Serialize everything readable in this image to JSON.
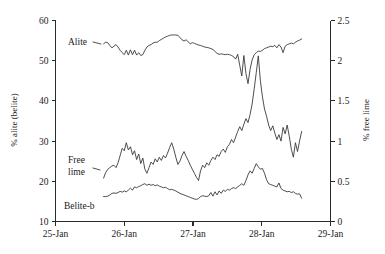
{
  "chart_data": {
    "type": "line",
    "title": "",
    "xlabel": "",
    "ylabel": "% alite (belite)",
    "y2label": "% free lime",
    "grid": false,
    "legend": "inline-labels",
    "xlim": [
      25,
      29
    ],
    "ylim": [
      10,
      60
    ],
    "y2lim": [
      0,
      2.5
    ],
    "x_tick_labels": [
      "25-Jan",
      "26-Jan",
      "27-Jan",
      "28-Jan",
      "29-Jan"
    ],
    "x_tick_values": [
      25,
      26,
      27,
      28,
      29
    ],
    "y_tick_labels": [
      "10",
      "20",
      "30",
      "40",
      "50",
      "60"
    ],
    "y_tick_values": [
      10,
      20,
      30,
      40,
      50,
      60
    ],
    "y2_tick_labels": [
      "0",
      "0.5",
      "1",
      "1.5",
      "2",
      "2.5"
    ],
    "y2_tick_values": [
      0,
      0.5,
      1,
      1.5,
      2,
      2.5
    ],
    "series": [
      {
        "name": "Alite",
        "axis": "left",
        "label_text": "Alite",
        "x": [
          25.7,
          25.73,
          25.76,
          25.79,
          25.82,
          25.85,
          25.88,
          25.91,
          25.94,
          25.97,
          26.0,
          26.03,
          26.06,
          26.09,
          26.12,
          26.15,
          26.18,
          26.21,
          26.24,
          26.27,
          26.3,
          26.33,
          26.36,
          26.39,
          26.42,
          26.45,
          26.48,
          26.51,
          26.54,
          26.57,
          26.6,
          26.63,
          26.66,
          26.69,
          26.72,
          26.75,
          26.78,
          26.81,
          26.84,
          26.87,
          26.9,
          26.93,
          26.96,
          26.99,
          27.02,
          27.05,
          27.08,
          27.11,
          27.14,
          27.17,
          27.2,
          27.23,
          27.26,
          27.29,
          27.32,
          27.35,
          27.38,
          27.41,
          27.44,
          27.47,
          27.5,
          27.53,
          27.56,
          27.59,
          27.62,
          27.65,
          27.68,
          27.71,
          27.74,
          27.77,
          27.8,
          27.83,
          27.86,
          27.89,
          27.92,
          27.95,
          27.98,
          28.01,
          28.04,
          28.07,
          28.1,
          28.13,
          28.16,
          28.19,
          28.22,
          28.25,
          28.28,
          28.31,
          28.34,
          28.37,
          28.4,
          28.43,
          28.46,
          28.49,
          28.52,
          28.55,
          28.58
        ],
        "y": [
          54.2,
          54.6,
          54.5,
          53.8,
          53.2,
          53.6,
          54.0,
          53.4,
          52.6,
          52.0,
          51.5,
          52.6,
          51.4,
          52.7,
          51.5,
          52.6,
          51.4,
          52.0,
          51.3,
          51.5,
          52.6,
          53.4,
          53.8,
          54.0,
          54.4,
          54.6,
          54.6,
          55.0,
          55.3,
          55.6,
          55.9,
          56.1,
          56.3,
          56.4,
          56.4,
          56.4,
          56.3,
          55.8,
          55.2,
          54.9,
          55.2,
          54.7,
          54.2,
          54.5,
          54.3,
          54.1,
          53.9,
          53.8,
          53.6,
          53.4,
          53.3,
          53.2,
          53.0,
          52.8,
          52.3,
          51.8,
          51.6,
          51.7,
          51.6,
          51.5,
          51.6,
          51.5,
          51.3,
          51.0,
          50.4,
          51.6,
          48.8,
          46.2,
          51.3,
          46.8,
          44.3,
          47.8,
          50.2,
          51.5,
          52.0,
          52.4,
          52.3,
          52.6,
          53.0,
          53.2,
          53.4,
          53.6,
          53.5,
          53.8,
          53.2,
          54.0,
          53.4,
          52.0,
          53.6,
          54.0,
          54.2,
          54.4,
          54.2,
          54.6,
          54.9,
          55.1,
          55.4
        ],
        "value_range_left_axis": [
          44.3,
          56.4
        ]
      },
      {
        "name": "Free lime",
        "axis": "right",
        "label_text": "Free lime",
        "x": [
          25.7,
          25.73,
          25.76,
          25.79,
          25.82,
          25.85,
          25.88,
          25.91,
          25.94,
          25.97,
          26.0,
          26.03,
          26.06,
          26.09,
          26.12,
          26.15,
          26.18,
          26.21,
          26.24,
          26.27,
          26.3,
          26.33,
          26.36,
          26.39,
          26.42,
          26.45,
          26.48,
          26.51,
          26.54,
          26.57,
          26.6,
          26.63,
          26.66,
          26.69,
          26.72,
          26.75,
          26.78,
          26.81,
          26.84,
          26.87,
          26.9,
          26.93,
          26.96,
          26.99,
          27.02,
          27.05,
          27.08,
          27.11,
          27.14,
          27.17,
          27.2,
          27.23,
          27.26,
          27.29,
          27.32,
          27.35,
          27.38,
          27.41,
          27.44,
          27.47,
          27.5,
          27.53,
          27.56,
          27.59,
          27.62,
          27.65,
          27.68,
          27.71,
          27.74,
          27.77,
          27.8,
          27.83,
          27.86,
          27.89,
          27.92,
          27.95,
          27.98,
          28.01,
          28.04,
          28.07,
          28.1,
          28.13,
          28.16,
          28.19,
          28.22,
          28.25,
          28.28,
          28.31,
          28.34,
          28.37,
          28.4,
          28.43,
          28.46,
          28.49,
          28.52,
          28.55,
          28.58
        ],
        "y_left_axis_equiv": [
          20.8,
          22.2,
          23.0,
          23.5,
          23.8,
          24.0,
          23.5,
          24.6,
          26.4,
          28.2,
          27.6,
          29.6,
          27.8,
          28.6,
          26.6,
          27.6,
          25.4,
          26.8,
          24.5,
          25.8,
          23.0,
          22.0,
          23.4,
          24.8,
          24.2,
          25.6,
          24.8,
          26.0,
          25.2,
          26.5,
          25.8,
          27.0,
          28.4,
          29.7,
          28.0,
          26.0,
          24.2,
          25.0,
          26.4,
          27.5,
          26.2,
          25.2,
          24.0,
          23.0,
          22.0,
          21.0,
          20.2,
          22.6,
          24.0,
          23.4,
          24.6,
          24.0,
          25.2,
          26.0,
          25.4,
          26.6,
          26.2,
          27.4,
          28.0,
          27.2,
          28.6,
          29.2,
          30.4,
          29.6,
          31.0,
          32.4,
          33.6,
          32.6,
          34.2,
          35.6,
          34.6,
          36.6,
          39.2,
          43.0,
          47.0,
          51.2,
          45.0,
          41.0,
          38.0,
          36.2,
          34.0,
          32.6,
          33.8,
          32.0,
          30.4,
          31.6,
          30.0,
          33.4,
          31.8,
          34.0,
          31.2,
          28.0,
          26.0,
          29.6,
          27.4,
          30.0,
          32.4
        ],
        "y": [
          0.54,
          0.61,
          0.65,
          0.67,
          0.69,
          0.7,
          0.67,
          0.73,
          0.82,
          0.91,
          0.88,
          0.98,
          0.89,
          0.93,
          0.83,
          0.88,
          0.77,
          0.84,
          0.72,
          0.79,
          0.65,
          0.6,
          0.67,
          0.74,
          0.71,
          0.78,
          0.74,
          0.8,
          0.76,
          0.82,
          0.79,
          0.85,
          0.92,
          0.98,
          0.9,
          0.8,
          0.71,
          0.75,
          0.82,
          0.87,
          0.81,
          0.76,
          0.7,
          0.65,
          0.6,
          0.55,
          0.51,
          0.63,
          0.7,
          0.67,
          0.73,
          0.7,
          0.76,
          0.8,
          0.77,
          0.83,
          0.81,
          0.87,
          0.9,
          0.86,
          0.93,
          0.96,
          1.02,
          0.98,
          1.05,
          1.12,
          1.18,
          1.13,
          1.21,
          1.28,
          1.23,
          1.33,
          1.46,
          1.65,
          1.85,
          2.06,
          1.75,
          1.55,
          1.4,
          1.31,
          1.2,
          1.13,
          1.19,
          1.1,
          1.02,
          1.08,
          1.0,
          1.17,
          1.09,
          1.2,
          1.06,
          0.9,
          0.8,
          0.98,
          0.87,
          1.0,
          1.12
        ],
        "value_range_right_axis": [
          0.51,
          2.06
        ]
      },
      {
        "name": "Belite-b",
        "axis": "left",
        "label_text": "Belite-b",
        "x": [
          25.7,
          25.73,
          25.76,
          25.79,
          25.82,
          25.85,
          25.88,
          25.91,
          25.94,
          25.97,
          26.0,
          26.03,
          26.06,
          26.09,
          26.12,
          26.15,
          26.18,
          26.21,
          26.24,
          26.27,
          26.3,
          26.33,
          26.36,
          26.39,
          26.42,
          26.45,
          26.48,
          26.51,
          26.54,
          26.57,
          26.6,
          26.63,
          26.66,
          26.69,
          26.72,
          26.75,
          26.78,
          26.81,
          26.84,
          26.87,
          26.9,
          26.93,
          26.96,
          26.99,
          27.02,
          27.05,
          27.08,
          27.11,
          27.14,
          27.17,
          27.2,
          27.23,
          27.26,
          27.29,
          27.32,
          27.35,
          27.38,
          27.41,
          27.44,
          27.47,
          27.5,
          27.53,
          27.56,
          27.59,
          27.62,
          27.65,
          27.68,
          27.71,
          27.74,
          27.77,
          27.8,
          27.83,
          27.86,
          27.89,
          27.92,
          27.95,
          27.98,
          28.01,
          28.04,
          28.07,
          28.1,
          28.13,
          28.16,
          28.19,
          28.22,
          28.25,
          28.28,
          28.31,
          28.34,
          28.37,
          28.4,
          28.43,
          28.46,
          28.49,
          28.52,
          28.55,
          28.58
        ],
        "y": [
          16.2,
          16.2,
          16.3,
          16.6,
          17.0,
          17.1,
          17.0,
          17.2,
          17.5,
          17.3,
          17.6,
          17.4,
          17.8,
          18.3,
          17.8,
          18.6,
          18.4,
          18.7,
          18.9,
          19.2,
          19.4,
          19.0,
          19.3,
          19.0,
          19.2,
          18.9,
          19.1,
          18.8,
          18.6,
          18.4,
          18.5,
          18.2,
          17.9,
          18.0,
          17.8,
          17.6,
          17.3,
          17.0,
          16.8,
          16.6,
          16.4,
          16.2,
          16.0,
          15.8,
          15.6,
          15.5,
          15.7,
          16.2,
          16.4,
          16.3,
          16.2,
          16.4,
          17.2,
          16.3,
          17.4,
          16.6,
          17.6,
          17.0,
          17.8,
          17.5,
          18.0,
          17.8,
          18.2,
          18.4,
          18.2,
          18.6,
          19.0,
          19.4,
          19.0,
          20.2,
          21.6,
          22.6,
          22.0,
          23.2,
          24.4,
          23.6,
          23.0,
          23.2,
          22.0,
          20.4,
          19.4,
          19.2,
          19.0,
          18.8,
          18.6,
          19.6,
          18.2,
          17.8,
          17.6,
          17.4,
          17.5,
          17.2,
          17.4,
          17.0,
          16.8,
          16.9,
          15.8
        ],
        "value_range_left_axis": [
          15.5,
          24.4
        ]
      }
    ]
  },
  "annotations": {
    "alite_label": "Alite",
    "free_lime_label_line1": "Free",
    "free_lime_label_line2": "lime",
    "belite_label": "Belite-b"
  },
  "colors": {
    "line": "#3a3a3a",
    "axis": "#2b2b2b",
    "text": "#1a1a1a",
    "background": "#ffffff"
  }
}
